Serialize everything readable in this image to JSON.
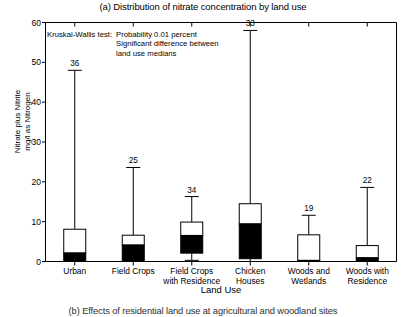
{
  "chart_data": {
    "type": "box",
    "title": "(a) Distribution of nitrate concentration by land use",
    "subcaption": "(b) Effects of residential land use at agricultural and woodland sites",
    "xlabel": "Land Use",
    "ylabel_line1": "Nitrate plus Nitrite",
    "ylabel_line2": "mg/l as Nitrogen",
    "ylim": [
      0,
      60
    ],
    "yticks": [
      0,
      10,
      20,
      30,
      40,
      50,
      60
    ],
    "ytick_labels": [
      "0",
      "10",
      "20",
      "30",
      "40",
      "50",
      "60"
    ],
    "grid": false,
    "legend_position": "none",
    "categories": [
      "Urban",
      "Field Crops",
      "Field Crops\nwith Residence",
      "Chicken\nHouses",
      "Woods and\nWetlands",
      "Woods with\nResidence"
    ],
    "category_lines": [
      [
        "Urban"
      ],
      [
        "Field Crops"
      ],
      [
        "Field Crops",
        "with Residence"
      ],
      [
        "Chicken",
        "Houses"
      ],
      [
        "Woods and",
        "Wetlands"
      ],
      [
        "Woods with",
        "Residence"
      ]
    ],
    "boxes": [
      {
        "category": "Urban",
        "lower_whisker": 0.0,
        "q1": 0.0,
        "median": 2.1,
        "q3": 8.1,
        "upper_whisker": 48.0,
        "n_label": "36"
      },
      {
        "category": "Field Crops",
        "lower_whisker": 0.0,
        "q1": 0.0,
        "median": 4.1,
        "q3": 6.6,
        "upper_whisker": 23.6,
        "n_label": "25"
      },
      {
        "category": "Field Crops with Residence",
        "lower_whisker": 0.3,
        "q1": 2.1,
        "median": 6.5,
        "q3": 9.9,
        "upper_whisker": 16.3,
        "n_label": "34"
      },
      {
        "category": "Chicken Houses",
        "lower_whisker": 0.0,
        "q1": 0.7,
        "median": 9.4,
        "q3": 14.5,
        "upper_whisker": 58.0,
        "n_label": "33"
      },
      {
        "category": "Woods and Wetlands",
        "lower_whisker": 0.0,
        "q1": 0.0,
        "median": 0.25,
        "q3": 6.7,
        "upper_whisker": 11.6,
        "n_label": "19"
      },
      {
        "category": "Woods with Residence",
        "lower_whisker": 0.0,
        "q1": 0.0,
        "median": 0.9,
        "q3": 4.0,
        "upper_whisker": 18.6,
        "n_label": "22"
      }
    ],
    "annotation": {
      "label": "Kruskal-Wallis test:",
      "lines": [
        "Probability 0.01 percent",
        "Significant difference between",
        "land use medians"
      ]
    },
    "colors": {
      "axis": "#000000",
      "box_fill_upper": "#ffffff",
      "box_fill_lower": "#000000",
      "whisker": "#000000",
      "background": "#ffffff"
    }
  }
}
